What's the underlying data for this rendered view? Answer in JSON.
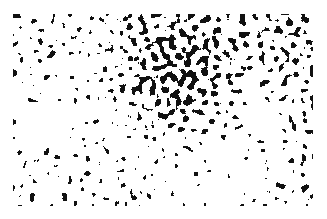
{
  "image": {
    "description": "Black and white labyrinthine / spinodal-decomposition noise pattern on white background",
    "width": 327,
    "height": 219,
    "pattern_bounds": {
      "x": 13,
      "y": 14,
      "width": 300,
      "height": 192
    },
    "colors": {
      "background": "#ffffff",
      "foreground": "#111111"
    },
    "feature_scale_px": 6,
    "density_regions": [
      {
        "name": "left-band",
        "cx": 0.12,
        "cy": 0.55,
        "r": 0.45,
        "bias": 0.1
      },
      {
        "name": "upper-center-light",
        "cx": 0.55,
        "cy": 0.3,
        "r": 0.3,
        "bias": -0.14
      },
      {
        "name": "right-labyrinth",
        "cx": 0.8,
        "cy": 0.45,
        "r": 0.2,
        "bias": 0.08
      },
      {
        "name": "lower-right-dense",
        "cx": 0.68,
        "cy": 0.95,
        "r": 0.35,
        "bias": 0.14
      },
      {
        "name": "top-right-light",
        "cx": 0.95,
        "cy": 0.05,
        "r": 0.2,
        "bias": -0.06
      }
    ],
    "seed": 7331
  }
}
